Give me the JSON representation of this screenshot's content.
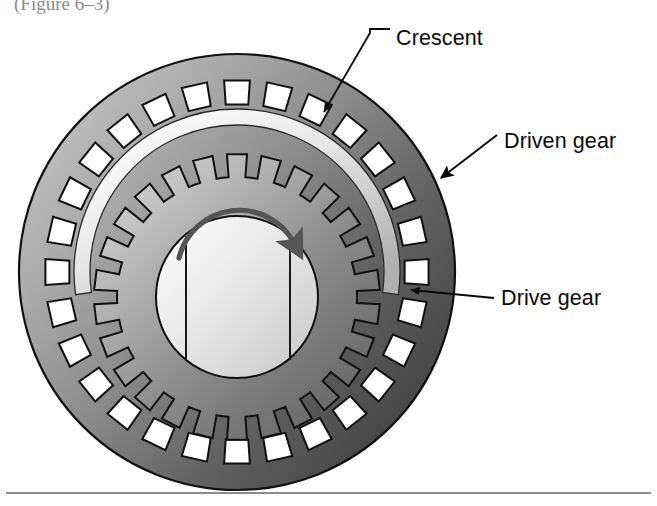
{
  "figure": {
    "title_clipped": "(Figure 6–3)",
    "background_color": "#ffffff",
    "width": 657,
    "height": 506
  },
  "labels": {
    "crescent": "Crescent",
    "driven_gear": "Driven gear",
    "drive_gear": "Drive gear"
  },
  "label_positions": {
    "crescent": {
      "x": 396,
      "y": 45
    },
    "driven_gear": {
      "x": 504,
      "y": 148
    },
    "drive_gear": {
      "x": 501,
      "y": 305
    }
  },
  "colors": {
    "outer_ring_light": "#b4b4b4",
    "outer_ring_dark": "#4e4e4e",
    "outer_ring_mid": "#7d7d7d",
    "inner_gear_light": "#cfcfcf",
    "inner_gear_dark": "#6b6b6b",
    "crescent_light": "#f2f2f2",
    "crescent_shade": "#b8b8b8",
    "hub_light": "#f0f0f0",
    "hub_shade": "#c8c8c8",
    "tooth_gap": "#ffffff",
    "outline": "#111111",
    "rotation_arrow": "#555555",
    "label_text": "#0a0a0a",
    "rule_line": "#1a1a1a"
  },
  "geometry": {
    "assembly_center": {
      "x": 237,
      "y": 272
    },
    "outer_ring_outer_radius": 218,
    "outer_ring_tooth_tip_radius": 168,
    "outer_ring_tooth_root_radius": 192,
    "outer_ring_tooth_count": 28,
    "inner_gear_center": {
      "x": 237,
      "y": 297
    },
    "inner_gear_tip_radius": 143,
    "inner_gear_root_radius": 120,
    "inner_gear_tooth_count": 26,
    "hub_radius": 81,
    "crescent_outer_radius": 163,
    "crescent_inner_radius": 147,
    "crescent_start_angle_deg": 172,
    "crescent_end_angle_deg": 368
  },
  "rotation_arrow": {
    "direction": "clockwise",
    "arc_center": {
      "x": 237,
      "y": 268
    },
    "arc_radius": 62
  },
  "baseline_rule": {
    "y": 493,
    "x_start": 6,
    "x_end": 651
  },
  "icon_names": [
    "crescent-leader-icon",
    "driven-gear-arrow-icon",
    "drive-gear-leader-icon",
    "rotation-arrow-icon"
  ]
}
